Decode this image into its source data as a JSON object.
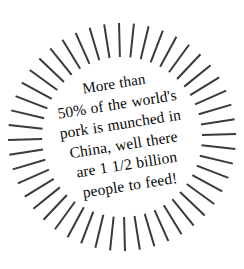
{
  "canvas": {
    "width": 244,
    "height": 269,
    "background_color": "#ffffff"
  },
  "sunburst": {
    "name": "sunburst-rays",
    "ray_count": 48,
    "center_x": 122,
    "center_y": 137,
    "inner_radius": 80,
    "outer_radius": 114,
    "stroke_width": 2,
    "stroke_color": "#3a3a3a",
    "start_angle_deg": -9
  },
  "fact": {
    "text_color": "#0a0a0a",
    "rotation_deg": -9,
    "full_text": "More than 50% of the world's pork is munched in China, well there are 1 1/2 billion people to feed!",
    "lines": [
      "More than",
      "50% of the world's",
      "pork is munched in",
      "China, well there",
      "are 1 1/2 billion",
      "people to feed!"
    ]
  }
}
